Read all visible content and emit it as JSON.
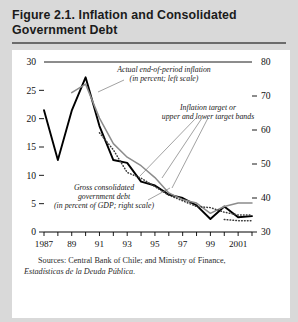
{
  "figure": {
    "title": "Figure 2.1. Inflation and Consolidated Government Debt",
    "source_line1": "Sources: Central Bank of Chile; and Ministry of Finance,",
    "source_line2": "Estadísticas de la Deuda Pública."
  },
  "colors": {
    "page_background": "#d9d9d9",
    "panel_background": "#ffffff",
    "inflation_line": "#000000",
    "debt_line": "#8c8c8c",
    "target_band": "#3a3a3a",
    "axis": "#000000",
    "title_rule": "#6b6b6b"
  },
  "chart_data": {
    "type": "line",
    "title": "Figure 2.1. Inflation and Consolidated Government Debt",
    "xlabel": "",
    "ylabel": "",
    "grid": false,
    "legend": "annotations",
    "x": [
      1987,
      1988,
      1989,
      1990,
      1991,
      1992,
      1993,
      1994,
      1995,
      1996,
      1997,
      1998,
      1999,
      2000,
      2001,
      2002
    ],
    "xtick_values": [
      1987,
      1988,
      1989,
      1990,
      1991,
      1992,
      1993,
      1994,
      1995,
      1996,
      1997,
      1998,
      1999,
      2000,
      2001,
      2002
    ],
    "xtick_labels": [
      "1987",
      "",
      "89",
      "",
      "91",
      "",
      "93",
      "",
      "95",
      "",
      "97",
      "",
      "99",
      "",
      "2001",
      ""
    ],
    "xlim": [
      1987,
      2002
    ],
    "left_axis": {
      "label": "in percent",
      "ylim": [
        0,
        30
      ],
      "ticks": [
        0,
        5,
        10,
        15,
        20,
        25,
        30
      ],
      "tick_labels": [
        "0",
        "5",
        "10",
        "15",
        "20",
        "25",
        "30"
      ]
    },
    "right_axis": {
      "label": "in percent of GDP",
      "ylim": [
        30,
        80
      ],
      "ticks": [
        30,
        40,
        50,
        60,
        70,
        80
      ],
      "tick_labels": [
        "30",
        "40",
        "50",
        "60",
        "70",
        "80"
      ]
    },
    "series": [
      {
        "name": "Actual end-of-period inflation",
        "axis": "left",
        "style": "solid",
        "color": "#000000",
        "values": [
          21.5,
          12.7,
          21.4,
          27.3,
          18.7,
          12.7,
          12.2,
          8.9,
          8.2,
          6.6,
          6.0,
          4.7,
          2.3,
          4.5,
          2.6,
          2.8
        ]
      },
      {
        "name": "Gross consolidated government debt",
        "axis": "right",
        "style": "solid",
        "color": "#8c8c8c",
        "values": [
          null,
          null,
          71.0,
          73.5,
          63.5,
          56.0,
          52.0,
          49.5,
          46.0,
          41.5,
          39.5,
          38.5,
          35.5,
          37.5,
          38.5,
          38.5
        ]
      },
      {
        "name": "Inflation target or upper and lower target bands",
        "axis": "left",
        "style": "dotted",
        "color": "#3a3a3a",
        "values": [
          null,
          null,
          null,
          null,
          17.5,
          14.5,
          10.5,
          9.5,
          8.0,
          6.5,
          5.5,
          4.5,
          4.3,
          3.5,
          3.0,
          3.0
        ]
      },
      {
        "name": "Inflation target lower band",
        "axis": "left",
        "style": "dotted",
        "color": "#3a3a3a",
        "values": [
          null,
          null,
          null,
          null,
          null,
          null,
          null,
          null,
          null,
          null,
          null,
          null,
          null,
          2.2,
          2.0,
          2.0
        ]
      }
    ],
    "annotations": [
      {
        "id": "inflation-annotation",
        "line1": "Actual end-of-period inflation",
        "line2": "(in percent; left scale)"
      },
      {
        "id": "target-annotation",
        "line1": "Inflation target or",
        "line2": "upper and lower target bands"
      },
      {
        "id": "debt-annotation",
        "line1": "Gross consolidated",
        "line2": "government debt",
        "line3": "(in percent of GDP; right scale)"
      }
    ]
  }
}
